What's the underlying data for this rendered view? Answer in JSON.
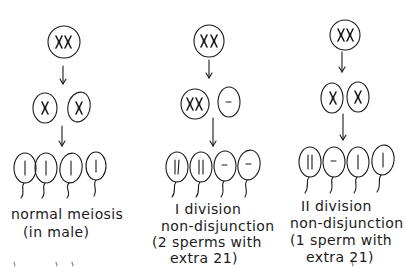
{
  "diagram": {
    "type": "meiosis-nondisjunction-comparison",
    "columns": [
      {
        "id": "normal",
        "caption_lines": [
          "normal meiosis",
          "(in male)"
        ],
        "parent_cell": {
          "content": "XX"
        },
        "second_division_cells": [
          {
            "content": "X"
          },
          {
            "content": "X"
          }
        ],
        "sperm": [
          {
            "content": "|"
          },
          {
            "content": "|"
          },
          {
            "content": "|"
          },
          {
            "content": "|"
          }
        ]
      },
      {
        "id": "first-division-nondisjunction",
        "caption_lines": [
          "I division",
          "non-disjunction",
          "(2 sperms with",
          "extra 21)"
        ],
        "parent_cell": {
          "content": "XX"
        },
        "second_division_cells": [
          {
            "content": "XX"
          },
          {
            "content": "-"
          }
        ],
        "sperm": [
          {
            "content": "||"
          },
          {
            "content": "||"
          },
          {
            "content": "-"
          },
          {
            "content": "-"
          }
        ]
      },
      {
        "id": "second-division-nondisjunction",
        "caption_lines": [
          "II division",
          "non-disjunction",
          "(1 sperm with",
          "extra 21)"
        ],
        "parent_cell": {
          "content": "XX"
        },
        "second_division_cells": [
          {
            "content": "X"
          },
          {
            "content": "X"
          }
        ],
        "sperm": [
          {
            "content": "||"
          },
          {
            "content": "-"
          },
          {
            "content": "|"
          },
          {
            "content": "|"
          }
        ]
      }
    ]
  }
}
